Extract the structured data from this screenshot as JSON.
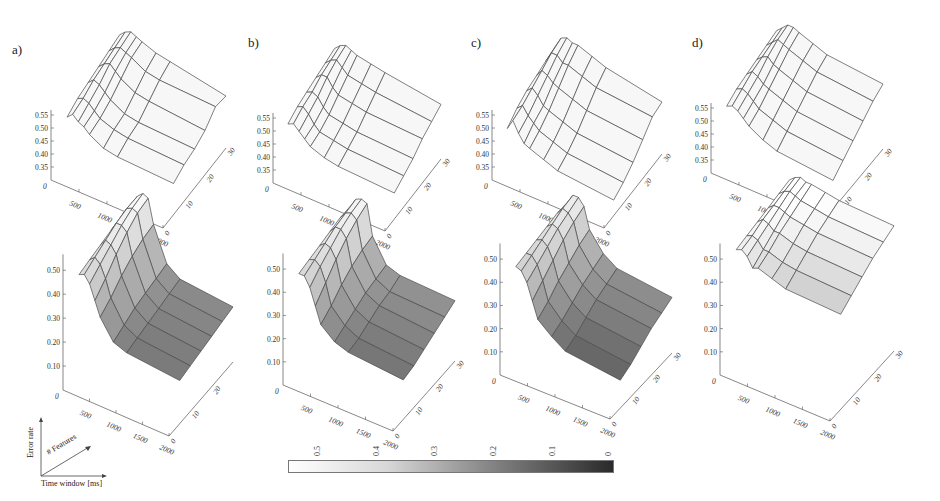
{
  "figure": {
    "panel_labels": [
      "a)",
      "b)",
      "c)",
      "d)"
    ],
    "colorbar": {
      "ticks": [
        "0.5",
        "0.4",
        "0.3",
        "0.2",
        "0.1",
        "0"
      ],
      "color_low": "#2a2a2a",
      "color_high": "#ffffff"
    },
    "legend": {
      "z_label": "Error rate",
      "depth_label": "# Features",
      "x_label": "Time window [ms]"
    }
  },
  "chart_data": [
    {
      "id": "a-top",
      "panel": "a)",
      "row": "top",
      "type": "surface",
      "shading": "wireframe",
      "xlabel": "Time window [ms]",
      "ylabel": "# Features",
      "zlabel": "Error rate",
      "x_ticks": [
        "0",
        "500",
        "1000",
        "1500",
        "2000"
      ],
      "y_ticks": [
        "0",
        "10",
        "20",
        "30"
      ],
      "z_ticks": [
        "0.35",
        "0.40",
        "0.45",
        "0.50",
        "0.55"
      ],
      "zlim": [
        0.3,
        0.55
      ],
      "x": [
        100,
        200,
        300,
        400,
        500,
        750,
        1000,
        2000
      ],
      "y": [
        5,
        10,
        15,
        20,
        25,
        30
      ],
      "z": [
        [
          0.5,
          0.52,
          0.5,
          0.49,
          0.47,
          0.44,
          0.43,
          0.42
        ],
        [
          0.52,
          0.53,
          0.52,
          0.5,
          0.48,
          0.46,
          0.45,
          0.44
        ],
        [
          0.53,
          0.55,
          0.54,
          0.52,
          0.5,
          0.47,
          0.46,
          0.45
        ],
        [
          0.54,
          0.56,
          0.57,
          0.55,
          0.53,
          0.5,
          0.49,
          0.47
        ],
        [
          0.55,
          0.57,
          0.58,
          0.57,
          0.56,
          0.53,
          0.52,
          0.51
        ],
        [
          0.56,
          0.58,
          0.59,
          0.58,
          0.57,
          0.55,
          0.54,
          0.5
        ]
      ]
    },
    {
      "id": "a-bottom",
      "panel": "a)",
      "row": "bottom",
      "type": "surface",
      "shading": "colormap",
      "xlabel": "Time window [ms]",
      "ylabel": "# Features",
      "zlabel": "Error rate",
      "x_ticks": [
        "0",
        "500",
        "1000",
        "1500",
        "2000"
      ],
      "y_ticks": [
        "0",
        "10",
        "20"
      ],
      "z_ticks": [
        "0.10",
        "0.20",
        "0.30",
        "0.40",
        "0.50"
      ],
      "zlim": [
        0.05,
        0.55
      ],
      "x": [
        100,
        200,
        300,
        400,
        500,
        750,
        1000,
        2000
      ],
      "y": [
        5,
        10,
        15,
        20,
        25,
        30
      ],
      "z": [
        [
          0.44,
          0.45,
          0.42,
          0.36,
          0.3,
          0.22,
          0.2,
          0.18
        ],
        [
          0.45,
          0.47,
          0.45,
          0.4,
          0.33,
          0.24,
          0.21,
          0.19
        ],
        [
          0.46,
          0.49,
          0.48,
          0.45,
          0.37,
          0.26,
          0.22,
          0.2
        ],
        [
          0.47,
          0.51,
          0.51,
          0.49,
          0.4,
          0.27,
          0.23,
          0.21
        ],
        [
          0.48,
          0.52,
          0.53,
          0.52,
          0.42,
          0.28,
          0.24,
          0.22
        ],
        [
          0.48,
          0.52,
          0.54,
          0.53,
          0.43,
          0.29,
          0.25,
          0.23
        ]
      ]
    },
    {
      "id": "b-top",
      "panel": "b)",
      "row": "top",
      "type": "surface",
      "shading": "wireframe",
      "xlabel": "Time window [ms]",
      "ylabel": "# Features",
      "zlabel": "Error rate",
      "x_ticks": [
        "0",
        "500",
        "1000",
        "1500",
        "2000"
      ],
      "y_ticks": [
        "0",
        "10",
        "20",
        "30"
      ],
      "z_ticks": [
        "0.35",
        "0.40",
        "0.45",
        "0.50",
        "0.55"
      ],
      "zlim": [
        0.3,
        0.55
      ],
      "x": [
        100,
        200,
        300,
        400,
        500,
        750,
        1000,
        2000
      ],
      "y": [
        5,
        10,
        15,
        20,
        25,
        30
      ],
      "z": [
        [
          0.49,
          0.5,
          0.48,
          0.46,
          0.44,
          0.42,
          0.41,
          0.4
        ],
        [
          0.51,
          0.52,
          0.5,
          0.47,
          0.45,
          0.44,
          0.43,
          0.42
        ],
        [
          0.52,
          0.53,
          0.52,
          0.49,
          0.47,
          0.46,
          0.45,
          0.44
        ],
        [
          0.53,
          0.55,
          0.55,
          0.52,
          0.5,
          0.49,
          0.48,
          0.47
        ],
        [
          0.54,
          0.56,
          0.57,
          0.55,
          0.53,
          0.52,
          0.51,
          0.49
        ],
        [
          0.55,
          0.57,
          0.58,
          0.57,
          0.56,
          0.55,
          0.54,
          0.51
        ]
      ]
    },
    {
      "id": "b-bottom",
      "panel": "b)",
      "row": "bottom",
      "type": "surface",
      "shading": "colormap",
      "xlabel": "Time window [ms]",
      "ylabel": "# Features",
      "zlabel": "Error rate",
      "x_ticks": [
        "0",
        "500",
        "1000",
        "1500",
        "2000"
      ],
      "y_ticks": [
        "0",
        "10",
        "20",
        "30"
      ],
      "z_ticks": [
        "0.10",
        "0.20",
        "0.30",
        "0.40",
        "0.50"
      ],
      "zlim": [
        0.05,
        0.55
      ],
      "x": [
        100,
        200,
        300,
        400,
        500,
        750,
        1000,
        2000
      ],
      "y": [
        5,
        10,
        15,
        20,
        25,
        30
      ],
      "z": [
        [
          0.44,
          0.44,
          0.4,
          0.33,
          0.26,
          0.21,
          0.19,
          0.17
        ],
        [
          0.45,
          0.46,
          0.44,
          0.38,
          0.29,
          0.23,
          0.2,
          0.18
        ],
        [
          0.46,
          0.48,
          0.47,
          0.43,
          0.33,
          0.25,
          0.22,
          0.2
        ],
        [
          0.47,
          0.5,
          0.5,
          0.47,
          0.36,
          0.27,
          0.24,
          0.22
        ],
        [
          0.48,
          0.51,
          0.52,
          0.5,
          0.38,
          0.28,
          0.25,
          0.24
        ],
        [
          0.48,
          0.52,
          0.53,
          0.52,
          0.39,
          0.29,
          0.27,
          0.26
        ]
      ]
    },
    {
      "id": "c-top",
      "panel": "c)",
      "row": "top",
      "type": "surface",
      "shading": "wireframe",
      "xlabel": "Time window [ms]",
      "ylabel": "# Features",
      "zlabel": "Error rate",
      "x_ticks": [
        "0",
        "500",
        "1000",
        "1500",
        "2000"
      ],
      "y_ticks": [
        "0",
        "10",
        "20",
        "30"
      ],
      "z_ticks": [
        "0.35",
        "0.40",
        "0.45",
        "0.50",
        "0.55"
      ],
      "zlim": [
        0.3,
        0.55
      ],
      "x": [
        100,
        200,
        300,
        400,
        500,
        750,
        1000,
        2000
      ],
      "y": [
        5,
        10,
        15,
        20,
        25,
        30
      ],
      "z": [
        [
          0.46,
          0.5,
          0.46,
          0.43,
          0.42,
          0.4,
          0.38,
          0.36
        ],
        [
          0.49,
          0.51,
          0.48,
          0.46,
          0.44,
          0.42,
          0.4,
          0.38
        ],
        [
          0.51,
          0.53,
          0.51,
          0.48,
          0.47,
          0.45,
          0.43,
          0.41
        ],
        [
          0.52,
          0.55,
          0.54,
          0.52,
          0.51,
          0.49,
          0.47,
          0.45
        ],
        [
          0.53,
          0.57,
          0.57,
          0.55,
          0.55,
          0.53,
          0.51,
          0.49
        ],
        [
          0.54,
          0.58,
          0.59,
          0.58,
          0.58,
          0.56,
          0.54,
          0.5
        ]
      ]
    },
    {
      "id": "c-bottom",
      "panel": "c)",
      "row": "bottom",
      "type": "surface",
      "shading": "colormap",
      "xlabel": "Time window [ms]",
      "ylabel": "# Features",
      "zlabel": "Error rate",
      "x_ticks": [
        "0",
        "500",
        "1000",
        "1500",
        "2000"
      ],
      "y_ticks": [
        "0",
        "10",
        "20",
        "30"
      ],
      "z_ticks": [
        "0.10",
        "0.20",
        "0.30",
        "0.40",
        "0.50"
      ],
      "zlim": [
        0.05,
        0.55
      ],
      "x": [
        100,
        200,
        300,
        400,
        500,
        750,
        1000,
        2000
      ],
      "y": [
        5,
        10,
        15,
        20,
        25,
        30
      ],
      "z": [
        [
          0.43,
          0.42,
          0.38,
          0.31,
          0.24,
          0.19,
          0.15,
          0.12
        ],
        [
          0.44,
          0.44,
          0.41,
          0.35,
          0.27,
          0.21,
          0.17,
          0.14
        ],
        [
          0.45,
          0.46,
          0.44,
          0.39,
          0.31,
          0.24,
          0.2,
          0.17
        ],
        [
          0.46,
          0.48,
          0.47,
          0.43,
          0.34,
          0.27,
          0.23,
          0.2
        ],
        [
          0.47,
          0.5,
          0.49,
          0.46,
          0.37,
          0.29,
          0.25,
          0.22
        ],
        [
          0.47,
          0.51,
          0.51,
          0.48,
          0.39,
          0.31,
          0.27,
          0.24
        ]
      ]
    },
    {
      "id": "d-top",
      "panel": "d)",
      "row": "top",
      "type": "surface",
      "shading": "wireframe",
      "xlabel": "Time window [ms]",
      "ylabel": "# Features",
      "zlabel": "Error rate",
      "x_ticks": [
        "0",
        "500",
        "1000",
        "1500",
        "2000"
      ],
      "y_ticks": [
        "0",
        "10",
        "20",
        "30"
      ],
      "z_ticks": [
        "0.35",
        "0.40",
        "0.45",
        "0.50",
        "0.55"
      ],
      "zlim": [
        0.3,
        0.55
      ],
      "x": [
        100,
        200,
        300,
        400,
        500,
        750,
        1000,
        2000
      ],
      "y": [
        5,
        10,
        15,
        20,
        25,
        30
      ],
      "z": [
        [
          0.52,
          0.53,
          0.52,
          0.5,
          0.48,
          0.45,
          0.43,
          0.41
        ],
        [
          0.54,
          0.55,
          0.54,
          0.52,
          0.5,
          0.48,
          0.46,
          0.44
        ],
        [
          0.55,
          0.57,
          0.56,
          0.54,
          0.53,
          0.51,
          0.49,
          0.47
        ],
        [
          0.56,
          0.58,
          0.59,
          0.57,
          0.56,
          0.54,
          0.52,
          0.5
        ],
        [
          0.57,
          0.59,
          0.61,
          0.6,
          0.59,
          0.57,
          0.55,
          0.53
        ],
        [
          0.58,
          0.6,
          0.62,
          0.62,
          0.61,
          0.59,
          0.57,
          0.55
        ]
      ]
    },
    {
      "id": "d-bottom",
      "panel": "d)",
      "row": "bottom",
      "type": "surface",
      "shading": "colormap",
      "xlabel": "Time window [ms]",
      "ylabel": "# Features",
      "zlabel": "Error rate",
      "x_ticks": [
        "0",
        "500",
        "1000",
        "1500",
        "2000"
      ],
      "y_ticks": [
        "0",
        "10",
        "20",
        "30"
      ],
      "z_ticks": [
        "0.10",
        "0.20",
        "0.30",
        "0.40",
        "0.50"
      ],
      "zlim": [
        0.05,
        0.55
      ],
      "x": [
        100,
        200,
        300,
        400,
        500,
        750,
        1000,
        2000
      ],
      "y": [
        5,
        10,
        15,
        20,
        25,
        30
      ],
      "z": [
        [
          0.5,
          0.51,
          0.49,
          0.45,
          0.46,
          0.44,
          0.42,
          0.41
        ],
        [
          0.51,
          0.52,
          0.51,
          0.48,
          0.48,
          0.46,
          0.45,
          0.44
        ],
        [
          0.52,
          0.54,
          0.53,
          0.51,
          0.51,
          0.49,
          0.48,
          0.47
        ],
        [
          0.53,
          0.55,
          0.55,
          0.54,
          0.53,
          0.52,
          0.51,
          0.5
        ],
        [
          0.54,
          0.56,
          0.57,
          0.56,
          0.55,
          0.54,
          0.53,
          0.52
        ],
        [
          0.55,
          0.57,
          0.58,
          0.57,
          0.57,
          0.56,
          0.55,
          0.54
        ]
      ]
    }
  ]
}
